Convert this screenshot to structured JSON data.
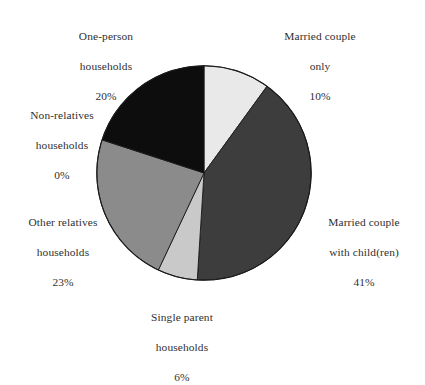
{
  "chart_data": {
    "type": "pie",
    "title": "",
    "subtitle": "",
    "xlabel": "",
    "ylabel": "",
    "legend_position": "none",
    "grid": false,
    "start_angle_deg": 0,
    "direction": "clockwise",
    "unit": "%",
    "categories": [
      "Married couple only",
      "Married couple with child(ren)",
      "Single parent households",
      "Other relatives households",
      "Non-relatives households",
      "One-person households"
    ],
    "values": [
      10,
      41,
      6,
      23,
      0,
      20
    ],
    "colors": [
      "#e9e9e9",
      "#3d3d3d",
      "#c9c9c9",
      "#8b8b8b",
      "#8b8b8b",
      "#0d0d0d"
    ],
    "slices": [
      {
        "id": "married-couple-only",
        "name_line_1": "Married couple",
        "name_line_2": "only",
        "value": 10,
        "value_label": "10%",
        "color": "#e9e9e9"
      },
      {
        "id": "married-couple-with-children",
        "name_line_1": "Married couple",
        "name_line_2": "with child(ren)",
        "value": 41,
        "value_label": "41%",
        "color": "#3d3d3d"
      },
      {
        "id": "single-parent-households",
        "name_line_1": "Single parent",
        "name_line_2": "households",
        "value": 6,
        "value_label": "6%",
        "color": "#c9c9c9"
      },
      {
        "id": "other-relatives-households",
        "name_line_1": "Other relatives",
        "name_line_2": "households",
        "value": 23,
        "value_label": "23%",
        "color": "#8b8b8b"
      },
      {
        "id": "non-relatives-households",
        "name_line_1": "Non-relatives",
        "name_line_2": "households",
        "value": 0,
        "value_label": "0%",
        "color": "#8b8b8b"
      },
      {
        "id": "one-person-households",
        "name_line_1": "One-person",
        "name_line_2": "households",
        "value": 20,
        "value_label": "20%",
        "color": "#0d0d0d"
      }
    ]
  },
  "labels": {
    "married_only": {
      "line1": "Married couple",
      "line2": "only",
      "value": "10%"
    },
    "one_person": {
      "line1": "One-person",
      "line2": "households",
      "value": "20%"
    },
    "non_relatives": {
      "line1": "Non-relatives",
      "line2": "households",
      "value": "0%"
    },
    "other_relatives": {
      "line1": "Other relatives",
      "line2": "households",
      "value": "23%"
    },
    "married_children": {
      "line1": "Married couple",
      "line2": "with child(ren)",
      "value": "41%"
    },
    "single_parent": {
      "line1": "Single parent",
      "line2": "households",
      "value": "6%"
    }
  },
  "style": {
    "outline_color": "#1a1a1a",
    "text_color": "#2f2f2f",
    "background": "#ffffff"
  }
}
